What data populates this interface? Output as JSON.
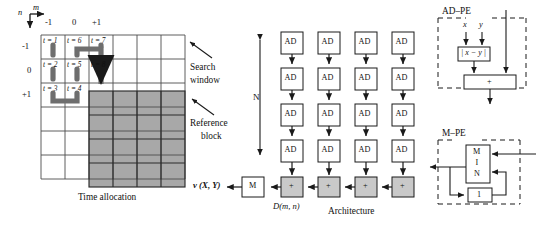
{
  "figure": {
    "left_panel": {
      "caption": "Time allocation",
      "axis": {
        "m_label": "m",
        "n_label": "n",
        "m_ticks": [
          "-1",
          "0",
          "+1"
        ],
        "n_ticks": [
          "-1",
          "0",
          "+1"
        ]
      },
      "grid": {
        "cols": 6,
        "rows": 6,
        "cell": 24
      },
      "time_cells": [
        {
          "label": "t = 1",
          "col": 0,
          "row": 0
        },
        {
          "label": "t = 6",
          "col": 1,
          "row": 0
        },
        {
          "label": "t = 7",
          "col": 2,
          "row": 0
        },
        {
          "label": "t = 2",
          "col": 0,
          "row": 1
        },
        {
          "label": "t = 5",
          "col": 1,
          "row": 1
        },
        {
          "label": "t = 8",
          "col": 2,
          "row": 1
        },
        {
          "label": "t = 3",
          "col": 0,
          "row": 2
        },
        {
          "label": "t = 4",
          "col": 1,
          "row": 2
        }
      ],
      "reference_block": {
        "start_col": 2,
        "start_row": 2,
        "cols": 4,
        "rows": 4,
        "fill": "#a8a8a8"
      },
      "annotations": [
        {
          "name": "search-window",
          "text_line1": "Search",
          "text_line2": "window"
        },
        {
          "name": "reference-block",
          "text_line1": "Reference",
          "text_line2": "block"
        }
      ]
    },
    "architecture": {
      "caption": "Architecture",
      "n_label": "N",
      "ad_label": "AD",
      "adder_label": "+",
      "min_block_label": "M",
      "columns": 4,
      "rows": 4,
      "output_label": "v (X, Y)",
      "sad_label": "D(m, n)"
    },
    "ad_pe": {
      "title": "AD–PE",
      "input_x": "x",
      "input_y": "y",
      "abs_diff_label": "| x − y |",
      "adder_label": "+"
    },
    "m_pe": {
      "title": "M–PE",
      "min_label_chars": [
        "M",
        "I",
        "N"
      ],
      "register_label": "1"
    },
    "colors": {
      "shade": "#a8a8a8",
      "line": "#1a1a1a",
      "grid_line": "#4d4d4d",
      "snake": "#6e6e6e"
    }
  }
}
